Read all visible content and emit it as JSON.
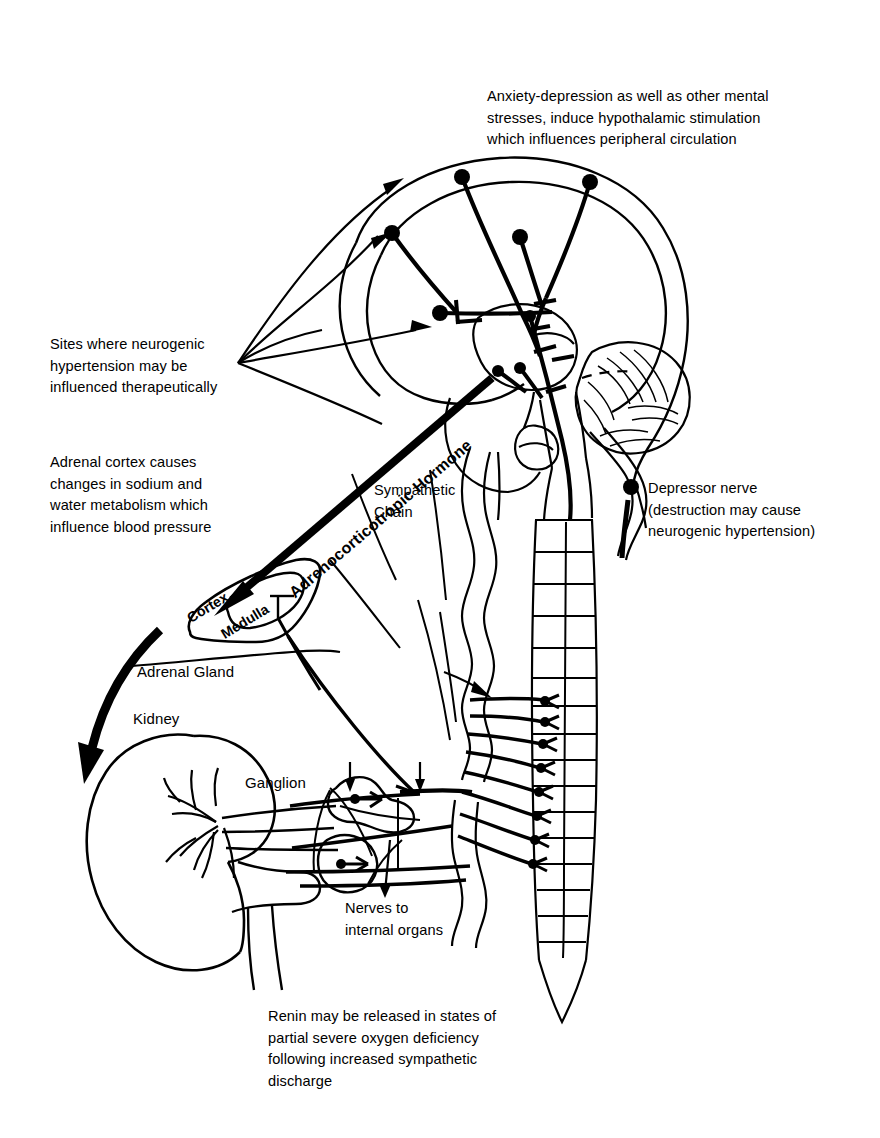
{
  "figure": {
    "type": "anatomical-diagram",
    "background_color": "#ffffff",
    "line_color": "#000000"
  },
  "captions": {
    "anxiety": "Anxiety-depression as well as other mental\nstresses, induce hypothalamic stimulation\nwhich influences peripheral circulation",
    "sites": "Sites where neurogenic\nhypertension may be\ninfluenced therapeutically",
    "adrenal_cortex": "Adrenal cortex causes\nchanges in sodium and\nwater metabolism which\ninfluence blood pressure",
    "depressor": "Depressor nerve\n(destruction may cause\nneurogenic hypertension)",
    "renin": "Renin may be released in states of\npartial severe oxygen deficiency\nfollowing increased sympathetic\ndischarge",
    "nerves_to_organs": "Nerves to\ninternal organs"
  },
  "labels": {
    "acth": "Adrenocorticotropic Hormone",
    "sympathetic_chain": "Sympathetic\nChain",
    "cortex": "Cortex",
    "medulla": "Medulla",
    "adrenal_gland": "Adrenal Gland",
    "kidney": "Kidney",
    "ganglion": "Ganglion"
  },
  "structures": [
    {
      "name": "cerebrum",
      "label": ""
    },
    {
      "name": "cerebellum",
      "label": ""
    },
    {
      "name": "hypothalamus",
      "label": ""
    },
    {
      "name": "brainstem",
      "label": ""
    },
    {
      "name": "spinal-column",
      "label": ""
    },
    {
      "name": "sympathetic-chain",
      "label": "Sympathetic Chain"
    },
    {
      "name": "adrenal-gland",
      "label": "Adrenal Gland"
    },
    {
      "name": "adrenal-cortex",
      "label": "Cortex"
    },
    {
      "name": "adrenal-medulla",
      "label": "Medulla"
    },
    {
      "name": "kidney",
      "label": "Kidney"
    },
    {
      "name": "ganglion-upper",
      "label": "Ganglion"
    },
    {
      "name": "ganglion-lower",
      "label": "Ganglion"
    },
    {
      "name": "depressor-nerve",
      "label": "Depressor nerve"
    }
  ],
  "counts": {
    "spinal_nerve_roots": 8,
    "cortical_neurons": 5,
    "therapeutic_pointer_arrows": 4
  }
}
